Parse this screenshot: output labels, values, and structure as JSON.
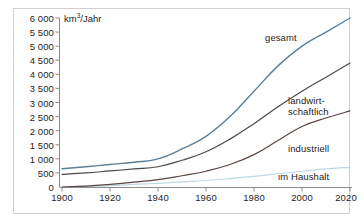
{
  "chart_data": {
    "type": "line",
    "title": "",
    "subtitle": "",
    "unit_label": "km³/Jahr",
    "xlabel": "",
    "ylabel": "",
    "xlim": [
      1900,
      2020
    ],
    "ylim": [
      0,
      6000
    ],
    "grid": false,
    "legend_position": "inline-right",
    "x_ticks": [
      1900,
      1920,
      1940,
      1960,
      1980,
      2000,
      2020
    ],
    "x_tick_labels": [
      "1900",
      "1920",
      "1940",
      "1960",
      "1980",
      "2000",
      "2020"
    ],
    "y_ticks": [
      0,
      500,
      1000,
      1500,
      2000,
      2500,
      3000,
      3500,
      4000,
      4500,
      5000,
      5500,
      6000
    ],
    "y_tick_labels": [
      "0",
      "500",
      "1 000",
      "1 500",
      "2 000",
      "2 500",
      "3 000",
      "3 500",
      "4 000",
      "4 500",
      "5 000",
      "5 500",
      "6 000"
    ],
    "x": [
      1900,
      1910,
      1920,
      1930,
      1940,
      1950,
      1960,
      1970,
      1980,
      1990,
      2000,
      2010,
      2020
    ],
    "series": [
      {
        "name": "gesamt",
        "color": "#5b7f96",
        "values": [
          650,
          720,
          800,
          880,
          1000,
          1350,
          1800,
          2500,
          3400,
          4300,
          5000,
          5500,
          6000
        ]
      },
      {
        "name": "landwirtschaftlich",
        "color": "#4a4a4a",
        "values": [
          450,
          500,
          570,
          640,
          720,
          950,
          1250,
          1700,
          2250,
          2850,
          3400,
          3900,
          4400
        ]
      },
      {
        "name": "industriell",
        "color": "#5a4640",
        "values": [
          0,
          30,
          90,
          170,
          260,
          400,
          560,
          800,
          1150,
          1650,
          2150,
          2450,
          2700
        ]
      },
      {
        "name": "im Haushalt",
        "color": "#bcd8e4",
        "values": [
          0,
          20,
          50,
          90,
          130,
          180,
          230,
          300,
          380,
          470,
          560,
          640,
          700
        ]
      }
    ],
    "series_labels": [
      {
        "text": "gesamt",
        "lines": [
          "gesamt"
        ]
      },
      {
        "text": "landwirtschaftlich",
        "lines": [
          "landwirt-",
          "schaftlich"
        ]
      },
      {
        "text": "industriell",
        "lines": [
          "industriell"
        ]
      },
      {
        "text": "im Haushalt",
        "lines": [
          "im Haushalt"
        ]
      }
    ],
    "axis_color": "#8c8c8c",
    "frame_color": "#cfcfcf",
    "background": "#ffffff"
  }
}
